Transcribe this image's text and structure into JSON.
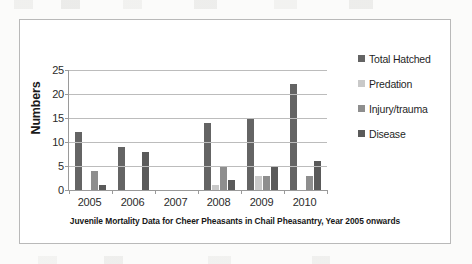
{
  "chart_data": {
    "type": "bar",
    "title": "",
    "caption": "Juvenile Mortality Data for Cheer Pheasants in Chail Pheasantry, Year 2005 onwards",
    "xlabel": "",
    "ylabel": "Numbers",
    "categories": [
      "2005",
      "2006",
      "2007",
      "2008",
      "2009",
      "2010"
    ],
    "ylim": [
      0,
      25
    ],
    "yticks": [
      0,
      5,
      10,
      15,
      20,
      25
    ],
    "ytick_labels": [
      "0",
      "5",
      "10",
      "15",
      "20",
      "25"
    ],
    "grid": true,
    "legend_position": "right",
    "series": [
      {
        "name": "Total Hatched",
        "color": "#646464",
        "values": [
          12,
          9,
          0,
          14,
          15,
          22
        ]
      },
      {
        "name": "Predation",
        "color": "#c9c9c9",
        "values": [
          0,
          0,
          0,
          1,
          3,
          0
        ]
      },
      {
        "name": "Injury/trauma",
        "color": "#8e8e8e",
        "values": [
          4,
          0,
          0,
          5,
          3,
          3
        ]
      },
      {
        "name": "Disease",
        "color": "#5a5a5a",
        "values": [
          1,
          8,
          0,
          2,
          5,
          6
        ]
      }
    ]
  }
}
